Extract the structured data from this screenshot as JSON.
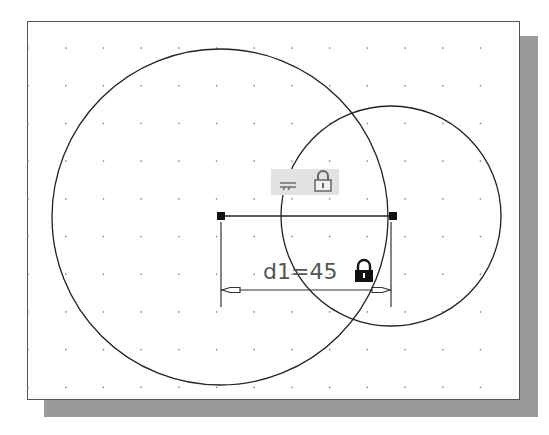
{
  "sketch": {
    "grid": {
      "origin_x": 28,
      "origin_y": 48,
      "spacing": 37.7,
      "cols": 13,
      "rows": 10,
      "dot_color": "#888888"
    },
    "circles": [
      {
        "name": "large-circle",
        "cx": 220,
        "cy": 217,
        "r": 168
      },
      {
        "name": "small-circle",
        "cx": 391,
        "cy": 216,
        "r": 110
      }
    ],
    "center_line": {
      "x1": 221,
      "y1": 216,
      "x2": 393,
      "y2": 216
    },
    "endpoints": [
      {
        "x": 221,
        "y": 216
      },
      {
        "x": 393,
        "y": 216
      }
    ],
    "relation_tag": {
      "symbol": "horizontal-constraint",
      "locked": true,
      "bg": "#e0e0e0"
    },
    "dimension": {
      "label": "d1=45",
      "name": "d1",
      "value": 45,
      "locked": true,
      "text_color": "#555555"
    }
  },
  "colors": {
    "line": "#222222",
    "frame_border": "#555555",
    "shadow": "#9a9a9a",
    "background": "#ffffff"
  }
}
